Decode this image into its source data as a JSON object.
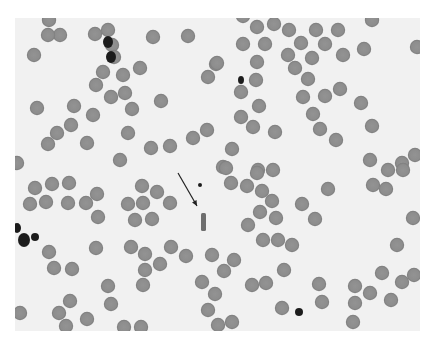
{
  "image": {
    "description": "Light-microscopy blood smear with red blood cells and an arrow pointing to a rod-shaped bacterium",
    "frame": {
      "x": 15,
      "y": 18,
      "width": 405,
      "height": 313
    },
    "colors": {
      "background": "#f1f1f1",
      "cell": "#8d8d8d",
      "cell_rim": "#7a7a7a",
      "dark": "#1e1e1e",
      "rod": "#6e6e6e",
      "arrow": "#222222"
    },
    "cell_radius": 7.2,
    "cells": [
      [
        49,
        20
      ],
      [
        60,
        35
      ],
      [
        48,
        35
      ],
      [
        34,
        55
      ],
      [
        95,
        34
      ],
      [
        108,
        30
      ],
      [
        112,
        45
      ],
      [
        114,
        57
      ],
      [
        153,
        37
      ],
      [
        188,
        36
      ],
      [
        103,
        72
      ],
      [
        123,
        75
      ],
      [
        140,
        68
      ],
      [
        96,
        85
      ],
      [
        111,
        97
      ],
      [
        125,
        93
      ],
      [
        132,
        109
      ],
      [
        37,
        108
      ],
      [
        74,
        106
      ],
      [
        93,
        115
      ],
      [
        71,
        125
      ],
      [
        57,
        133
      ],
      [
        48,
        144
      ],
      [
        87,
        143
      ],
      [
        128,
        133
      ],
      [
        120,
        160
      ],
      [
        151,
        148
      ],
      [
        170,
        146
      ],
      [
        193,
        138
      ],
      [
        207,
        130
      ],
      [
        161,
        101
      ],
      [
        208,
        77
      ],
      [
        216,
        64
      ],
      [
        17,
        163
      ],
      [
        257,
        27
      ],
      [
        274,
        24
      ],
      [
        289,
        30
      ],
      [
        316,
        30
      ],
      [
        338,
        30
      ],
      [
        243,
        44
      ],
      [
        265,
        44
      ],
      [
        301,
        43
      ],
      [
        325,
        44
      ],
      [
        288,
        55
      ],
      [
        312,
        58
      ],
      [
        343,
        55
      ],
      [
        364,
        49
      ],
      [
        417,
        47
      ],
      [
        217,
        63
      ],
      [
        257,
        62
      ],
      [
        295,
        68
      ],
      [
        256,
        80
      ],
      [
        308,
        79
      ],
      [
        241,
        92
      ],
      [
        303,
        97
      ],
      [
        325,
        96
      ],
      [
        340,
        89
      ],
      [
        361,
        103
      ],
      [
        259,
        106
      ],
      [
        241,
        117
      ],
      [
        253,
        127
      ],
      [
        313,
        114
      ],
      [
        320,
        129
      ],
      [
        275,
        132
      ],
      [
        336,
        140
      ],
      [
        232,
        149
      ],
      [
        223,
        167
      ],
      [
        258,
        170
      ],
      [
        273,
        170
      ],
      [
        372,
        126
      ],
      [
        370,
        160
      ],
      [
        388,
        170
      ],
      [
        415,
        155
      ],
      [
        402,
        163
      ],
      [
        243,
        16
      ],
      [
        372,
        20
      ],
      [
        35,
        188
      ],
      [
        52,
        184
      ],
      [
        69,
        183
      ],
      [
        30,
        204
      ],
      [
        46,
        202
      ],
      [
        68,
        203
      ],
      [
        86,
        203
      ],
      [
        97,
        194
      ],
      [
        98,
        217
      ],
      [
        142,
        186
      ],
      [
        157,
        192
      ],
      [
        170,
        203
      ],
      [
        128,
        204
      ],
      [
        143,
        203
      ],
      [
        135,
        220
      ],
      [
        152,
        219
      ],
      [
        49,
        252
      ],
      [
        54,
        268
      ],
      [
        72,
        269
      ],
      [
        96,
        248
      ],
      [
        131,
        247
      ],
      [
        145,
        254
      ],
      [
        160,
        264
      ],
      [
        145,
        270
      ],
      [
        143,
        285
      ],
      [
        171,
        247
      ],
      [
        186,
        256
      ],
      [
        108,
        286
      ],
      [
        70,
        301
      ],
      [
        59,
        313
      ],
      [
        20,
        313
      ],
      [
        111,
        304
      ],
      [
        87,
        319
      ],
      [
        66,
        326
      ],
      [
        124,
        327
      ],
      [
        141,
        327
      ],
      [
        202,
        282
      ],
      [
        208,
        310
      ],
      [
        226,
        168
      ],
      [
        257,
        173
      ],
      [
        231,
        183
      ],
      [
        247,
        186
      ],
      [
        262,
        191
      ],
      [
        272,
        201
      ],
      [
        260,
        212
      ],
      [
        276,
        218
      ],
      [
        248,
        225
      ],
      [
        263,
        240
      ],
      [
        278,
        240
      ],
      [
        292,
        245
      ],
      [
        302,
        204
      ],
      [
        315,
        219
      ],
      [
        328,
        189
      ],
      [
        212,
        255
      ],
      [
        234,
        260
      ],
      [
        224,
        271
      ],
      [
        284,
        270
      ],
      [
        252,
        285
      ],
      [
        266,
        283
      ],
      [
        319,
        284
      ],
      [
        322,
        302
      ],
      [
        355,
        286
      ],
      [
        355,
        303
      ],
      [
        370,
        293
      ],
      [
        391,
        300
      ],
      [
        382,
        273
      ],
      [
        402,
        282
      ],
      [
        414,
        275
      ],
      [
        413,
        218
      ],
      [
        397,
        245
      ],
      [
        218,
        325
      ],
      [
        232,
        322
      ],
      [
        282,
        308
      ],
      [
        353,
        322
      ],
      [
        373,
        185
      ],
      [
        386,
        189
      ],
      [
        403,
        170
      ],
      [
        215,
        294
      ]
    ],
    "dark_blobs": [
      [
        108,
        42,
        5,
        6
      ],
      [
        111,
        57,
        5,
        6
      ],
      [
        241,
        80,
        3,
        4
      ],
      [
        17,
        228,
        4,
        5
      ],
      [
        24,
        240,
        6,
        7
      ],
      [
        35,
        237,
        4,
        4
      ],
      [
        200,
        185,
        2,
        2
      ],
      [
        299,
        312,
        4,
        4
      ]
    ],
    "rod": {
      "x": 201,
      "y": 213,
      "width": 5,
      "height": 18
    },
    "arrow": {
      "x1": 178,
      "y1": 173,
      "x2": 197,
      "y2": 206
    }
  }
}
